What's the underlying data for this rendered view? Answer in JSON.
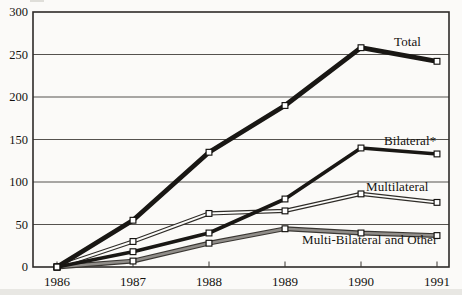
{
  "chart_data": {
    "type": "line",
    "x": [
      1986,
      1987,
      1988,
      1989,
      1990,
      1991
    ],
    "series": [
      {
        "name": "Total",
        "values": [
          0,
          55,
          135,
          190,
          258,
          242
        ],
        "style": "thick-black"
      },
      {
        "name": "Bilateral*",
        "values": [
          0,
          18,
          40,
          80,
          140,
          133
        ],
        "style": "black"
      },
      {
        "name": "Multilateral",
        "values": [
          0,
          30,
          63,
          66,
          86,
          76
        ],
        "style": "white-core-double"
      },
      {
        "name": "Multi-Bilateral and Other",
        "values": [
          0,
          7,
          28,
          45,
          40,
          37
        ],
        "style": "gray-core-double"
      }
    ],
    "title": "",
    "xlabel": "",
    "ylabel": "",
    "ylim": [
      0,
      300
    ],
    "yticks": [
      0,
      50,
      100,
      150,
      200,
      250,
      300
    ],
    "xticks": [
      "1986",
      "1987",
      "1988",
      "1989",
      "1990",
      "1991"
    ],
    "grid": "horizontal",
    "legend": "inline-labels",
    "marker": "open-square",
    "colors": {
      "ink": "#14120f",
      "gray_core": "#908d89",
      "white_core": "#fbfbf9",
      "background": "#fbfaf8"
    }
  }
}
